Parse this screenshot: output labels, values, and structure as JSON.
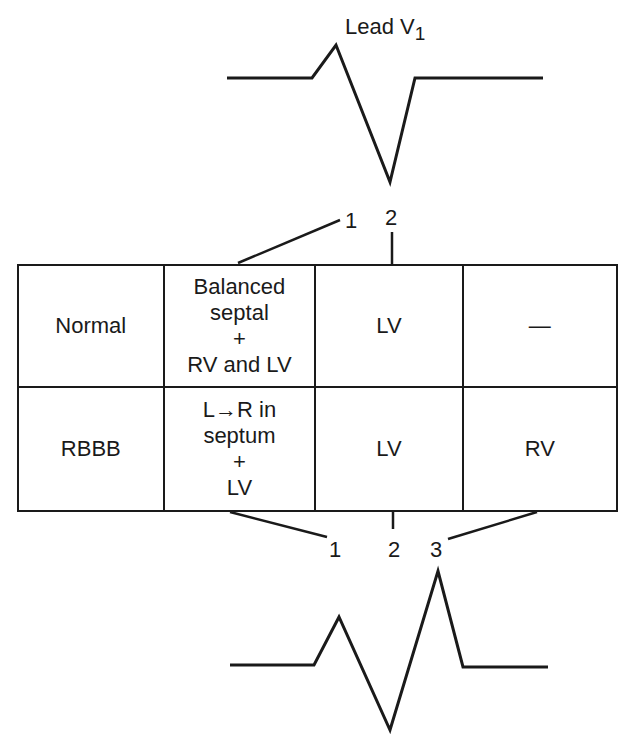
{
  "title": "Lead V",
  "title_subscript": "1",
  "top_markers": [
    "1",
    "2"
  ],
  "bottom_markers": [
    "1",
    "2",
    "3"
  ],
  "table": {
    "rows": [
      {
        "label": "Normal",
        "phase1": [
          "Balanced",
          "septal",
          "+",
          "RV and LV"
        ],
        "phase2": "LV",
        "phase3": "—"
      },
      {
        "label": "RBBB",
        "phase1": [
          "L→R in",
          "septum",
          "+",
          "LV"
        ],
        "phase2": "LV",
        "phase3": "RV"
      }
    ]
  },
  "waveforms": {
    "normal": "rS complex (small r, deep S)",
    "rbbb": "rSR' complex"
  },
  "colors": {
    "ink": "#1a1a1a",
    "background": "#ffffff"
  }
}
